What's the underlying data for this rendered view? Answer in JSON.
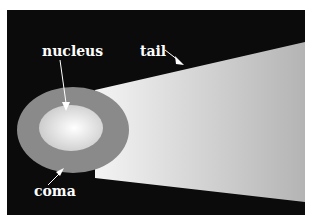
{
  "diagram": {
    "labels": {
      "nucleus": "nucleus",
      "tail": "tail",
      "coma": "coma"
    },
    "colors": {
      "background": "#0b0b0b",
      "coma": "#8a8a8a",
      "nucleus_center": "#ffffff",
      "nucleus_edge": "#c8c8c8",
      "tail_near": "#f4f4f4",
      "tail_far": "#b4b4b4",
      "label": "#ffffff"
    }
  }
}
